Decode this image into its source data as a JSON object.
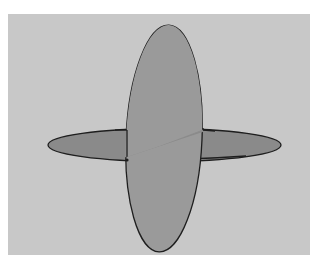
{
  "figure": {
    "colors": {
      "page_background": "#ffffff",
      "panel_background": "#c8c8c8",
      "vertical_disc_fill": "#9a9a9a",
      "horizontal_disc_fill": "#8a8a8a",
      "outline": "#1e1e1e"
    }
  }
}
